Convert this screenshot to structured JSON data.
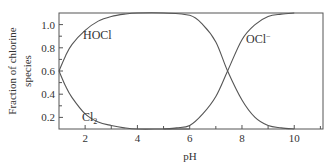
{
  "chart_data": {
    "type": "line",
    "title": "",
    "xlabel": "pH",
    "ylabel": "Fraction of chlorine species",
    "xlim": [
      1,
      11.1
    ],
    "ylim": [
      0.1,
      1.1
    ],
    "x_ticks": [
      2,
      4,
      6,
      8,
      10
    ],
    "y_ticks": [
      0.2,
      0.4,
      0.6,
      0.8,
      1.0
    ],
    "x_tick_labels": [
      "2",
      "4",
      "6",
      "8",
      "10"
    ],
    "y_tick_labels": [
      "0.2",
      "0.4",
      "0.6",
      "0.8",
      "1.0"
    ],
    "grid": false,
    "legend": "inline curve labels",
    "series": [
      {
        "name": "HOCl",
        "x": [
          1.0,
          1.25,
          1.5,
          2.0,
          2.5,
          3.0,
          3.5,
          4.0,
          5.0,
          6.0,
          6.5,
          7.0,
          7.45,
          8.0,
          8.5,
          9.0,
          9.5,
          10.0
        ],
        "values": [
          0.6,
          0.73,
          0.83,
          0.95,
          1.03,
          1.07,
          1.09,
          1.1,
          1.1,
          1.08,
          1.0,
          0.85,
          0.6,
          0.35,
          0.2,
          0.13,
          0.11,
          0.1
        ]
      },
      {
        "name": "Cl2",
        "x": [
          1.0,
          1.25,
          1.5,
          2.0,
          2.5,
          3.0,
          3.5,
          4.0,
          5.0,
          6.0
        ],
        "values": [
          0.6,
          0.47,
          0.37,
          0.23,
          0.16,
          0.13,
          0.11,
          0.1,
          0.1,
          0.1
        ]
      },
      {
        "name": "OCl−",
        "x": [
          5.0,
          5.5,
          6.0,
          6.5,
          7.0,
          7.45,
          8.0,
          8.5,
          9.0,
          9.5,
          10.0
        ],
        "values": [
          0.1,
          0.11,
          0.13,
          0.23,
          0.38,
          0.6,
          0.87,
          1.0,
          1.07,
          1.09,
          1.1
        ]
      }
    ],
    "annotations": [
      {
        "text": "HOCl",
        "x": 2.4,
        "y": 0.95
      },
      {
        "text": "Cl2",
        "x": 1.9,
        "y": 0.16
      },
      {
        "text": "OCl−",
        "x": 8.4,
        "y": 0.95
      }
    ]
  },
  "labels": {
    "ylabel_line1": "Fraction of chlorine",
    "ylabel_line2": "species",
    "xlabel": "pH",
    "hocl": "HOCl",
    "cl2_main": "Cl",
    "cl2_sub": "2",
    "ocl_main": "OCl",
    "ocl_sup": "−"
  },
  "colors": {
    "axis": "#555555",
    "curve": "#555555",
    "text": "#333333"
  }
}
